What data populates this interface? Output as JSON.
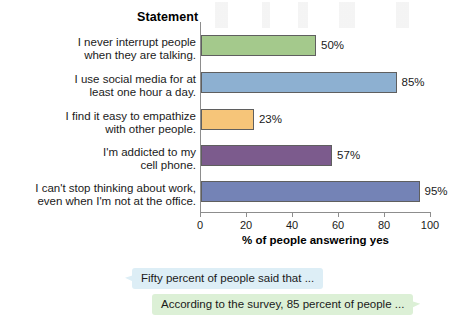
{
  "chart_data": {
    "type": "bar",
    "orientation": "horizontal",
    "title": "",
    "category_header": "Statement",
    "categories": [
      "I never interrupt people when they are talking.",
      "I use social media for at least one hour a day.",
      "I find it easy to empathize with other people.",
      "I'm addicted to my cell phone.",
      "I can't stop thinking about work, even when I'm not at the office."
    ],
    "category_lines": [
      [
        "I never interrupt people",
        "when they are talking."
      ],
      [
        "I use social media for at",
        "least one hour a day."
      ],
      [
        "I find it easy to empathize",
        "with other people."
      ],
      [
        "I'm addicted to my",
        "cell phone."
      ],
      [
        "I can't stop thinking about work,",
        "even when I'm not at the office."
      ]
    ],
    "values": [
      50,
      85,
      23,
      57,
      95
    ],
    "value_labels": [
      "50%",
      "85%",
      "23%",
      "57%",
      "95%"
    ],
    "bar_colors": [
      "#a4c98c",
      "#8db0d1",
      "#f6c579",
      "#7c5b8d",
      "#7483b6"
    ],
    "bar_border_color": "#5f5f5f",
    "xlabel": "% of people answering yes",
    "ylabel": "",
    "xlim": [
      0,
      100
    ],
    "xticks": [
      0,
      20,
      40,
      60,
      80,
      100
    ],
    "xtick_labels": [
      "0",
      "20",
      "40",
      "60",
      "80",
      "100"
    ],
    "grid": false,
    "legend": null
  },
  "callouts": [
    {
      "id": "bubble-fifty-percent",
      "text": "Fifty percent of people said that ...",
      "color": "#ddeef6"
    },
    {
      "id": "bubble-according-survey",
      "text": "According to the survey, 85 percent of people ...",
      "color": "#dcf0d6"
    }
  ]
}
